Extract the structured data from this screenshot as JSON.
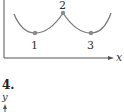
{
  "figure": {
    "points": [
      {
        "label": "1",
        "x": 35,
        "y": 33
      },
      {
        "label": "2",
        "x": 63,
        "y": 13
      },
      {
        "label": "3",
        "x": 91,
        "y": 33
      }
    ],
    "x_axis_label": "x",
    "next_problem_number": "4.",
    "next_y_axis_label": "y",
    "curve_color": "#7a7a7a",
    "point_color": "#8a8a8a"
  }
}
